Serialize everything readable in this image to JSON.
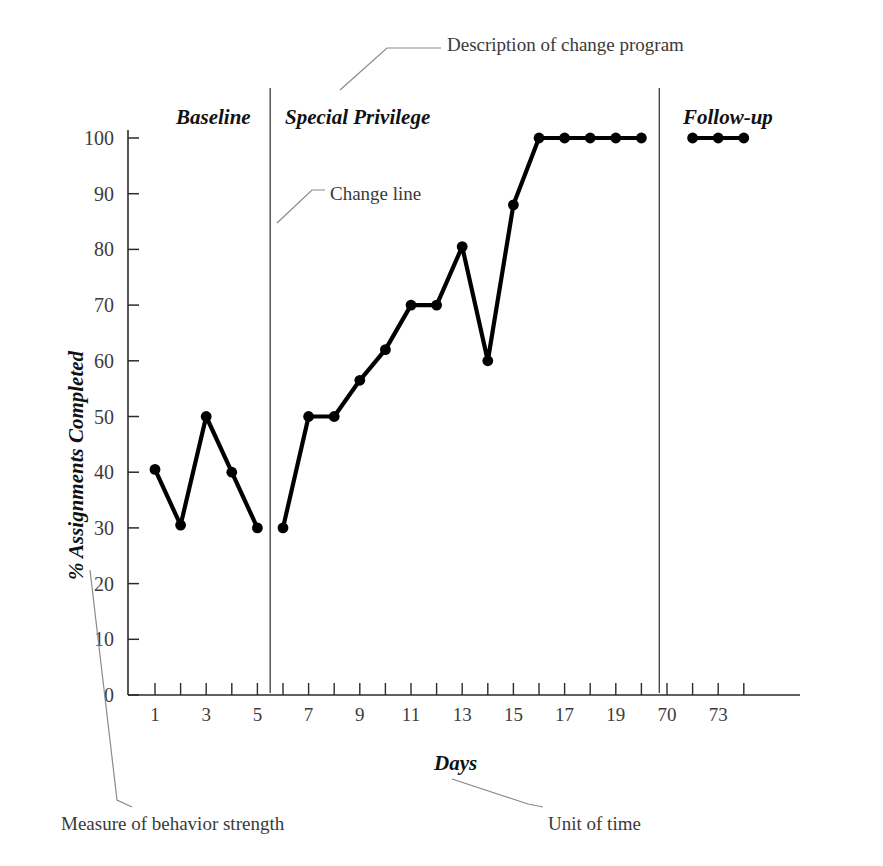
{
  "chart_data": {
    "type": "line",
    "title": "",
    "xlabel": "Days",
    "ylabel": "% Assignments Completed",
    "ylim": [
      0,
      100
    ],
    "ytick_values": [
      0,
      10,
      20,
      30,
      40,
      50,
      60,
      70,
      80,
      90,
      100
    ],
    "ytick_labels": [
      "0",
      "10",
      "20",
      "30",
      "40",
      "50",
      "60",
      "70",
      "80",
      "90",
      "100"
    ],
    "xtick_labels": [
      "1",
      "3",
      "5",
      "7",
      "9",
      "11",
      "13",
      "15",
      "17",
      "19",
      "70",
      "73"
    ],
    "xtick_positions": [
      1,
      3,
      5,
      7,
      9,
      11,
      13,
      15,
      17,
      19,
      21,
      23
    ],
    "grid": false,
    "legend": "none",
    "markers": "filled-circle",
    "line_color": "#000000",
    "series": [
      {
        "name": "Baseline",
        "x": [
          1,
          2,
          3,
          4,
          5
        ],
        "values": [
          40.5,
          30.5,
          50,
          40,
          30
        ]
      },
      {
        "name": "Special Privilege",
        "x": [
          6,
          7,
          8,
          9,
          10,
          11,
          12,
          13,
          14,
          15,
          16,
          17,
          18,
          19,
          20
        ],
        "values": [
          30,
          50,
          50,
          56.5,
          62,
          70,
          70,
          80.5,
          60,
          88,
          100,
          100,
          100,
          100,
          100
        ]
      },
      {
        "name": "Follow-up",
        "x": [
          22,
          23,
          24
        ],
        "values": [
          100,
          100,
          100
        ]
      }
    ]
  },
  "phases": [
    {
      "label": "Baseline",
      "x": 176,
      "y": 105
    },
    {
      "label": "Special Privilege",
      "x": 285,
      "y": 105
    },
    {
      "label": "Follow-up",
      "x": 683,
      "y": 105
    }
  ],
  "change_lines": [
    {
      "x_day": 5.5
    },
    {
      "x_day": 20.7
    }
  ],
  "annotations": [
    {
      "name": "description-of-change-program",
      "text": "Description of change program",
      "x": 447,
      "y": 34
    },
    {
      "name": "change-line",
      "text": "Change line",
      "x": 330,
      "y": 183
    },
    {
      "name": "measure-of-behavior-strength",
      "text": "Measure of behavior strength",
      "x": 61,
      "y": 813
    },
    {
      "name": "unit-of-time",
      "text": "Unit of time",
      "x": 548,
      "y": 813
    }
  ],
  "axis_titles": {
    "x": "Days",
    "y": "% Assignments Completed"
  },
  "colors": {
    "line": "#000000",
    "marker": "#000000",
    "axis": "#2b2b2b",
    "annotation_text": "#3a3a3a",
    "tick_text": "#3c3c3c",
    "leader": "#8a8a8a",
    "background": "#ffffff"
  }
}
